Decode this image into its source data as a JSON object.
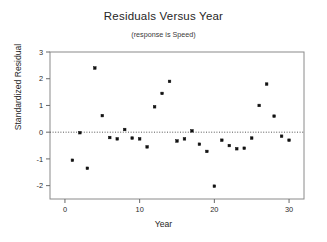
{
  "chart_data": {
    "type": "scatter",
    "title": "Residuals Versus Year",
    "subtitle": "(response is Speed)",
    "xlabel": "Year",
    "ylabel": "Standardized Residual",
    "xlim": [
      -2,
      32
    ],
    "ylim": [
      -2.5,
      3.0
    ],
    "xticks": [
      0,
      10,
      20,
      30
    ],
    "yticks": [
      -2,
      -1,
      0,
      1,
      2,
      3
    ],
    "grid": false,
    "legend": null,
    "reference_line": {
      "y": 0,
      "style": "dotted",
      "color": "#555555"
    },
    "marker": {
      "shape": "square",
      "color": "#111111",
      "size": 2.6
    },
    "x": [
      1,
      2,
      3,
      4,
      5,
      6,
      7,
      8,
      9,
      10,
      11,
      12,
      13,
      14,
      15,
      16,
      17,
      18,
      19,
      20,
      21,
      22,
      23,
      24,
      25,
      26,
      27,
      28,
      29,
      30
    ],
    "y": [
      -1.05,
      -0.02,
      -1.35,
      2.4,
      0.62,
      -0.2,
      -0.25,
      0.1,
      -0.22,
      -0.25,
      -0.55,
      0.95,
      1.45,
      1.9,
      -0.33,
      -0.25,
      0.05,
      -0.45,
      -0.72,
      -2.02,
      -0.3,
      -0.5,
      -0.62,
      -0.6,
      -0.22,
      1.0,
      1.8,
      0.6,
      -0.15,
      -0.3
    ],
    "frame": {
      "left": 50,
      "right": 304,
      "top": 52,
      "bottom": 199
    }
  }
}
